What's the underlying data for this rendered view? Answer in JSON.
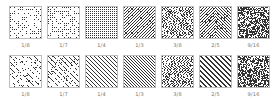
{
  "rows": [
    {
      "name": "dither-patterns-dots",
      "tiles": [
        {
          "label": "1/8",
          "pattern": "random-dots",
          "density": 0.125
        },
        {
          "label": "1/7",
          "pattern": "random-dots",
          "density": 0.143
        },
        {
          "label": "1/4",
          "pattern": "grid-dots",
          "density": 0.25
        },
        {
          "label": "1/3",
          "pattern": "diagonal-weave",
          "density": 0.333
        },
        {
          "label": "3/8",
          "pattern": "maze",
          "density": 0.375
        },
        {
          "label": "2/5",
          "pattern": "mixed-diagonal",
          "density": 0.4
        },
        {
          "label": "9/16",
          "pattern": "dense-noise",
          "density": 0.5625
        }
      ]
    },
    {
      "name": "dither-patterns-diagonal",
      "tiles": [
        {
          "label": "1/8",
          "pattern": "sparse-diagonal-dashes",
          "density": 0.125
        },
        {
          "label": "1/7",
          "pattern": "diagonal-dashes",
          "density": 0.143
        },
        {
          "label": "1/4",
          "pattern": "diagonal-lines",
          "density": 0.25
        },
        {
          "label": "1/3",
          "pattern": "fine-diagonal-lines",
          "density": 0.333
        },
        {
          "label": "3/8",
          "pattern": "maze",
          "density": 0.375
        },
        {
          "label": "2/5",
          "pattern": "thick-diagonal-lines",
          "density": 0.4
        },
        {
          "label": "9/16",
          "pattern": "dense-noise",
          "density": 0.5625
        }
      ]
    }
  ],
  "colors": {
    "ink": "#333333",
    "border": "#bdbdbd",
    "label": "#777777"
  }
}
